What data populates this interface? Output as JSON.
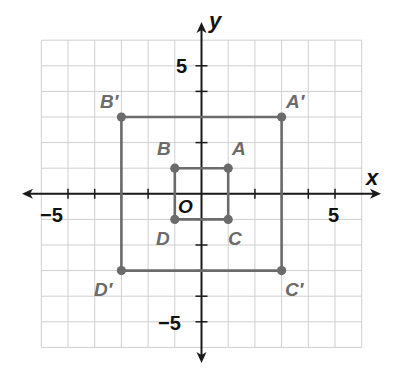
{
  "diagram": {
    "type": "coordinate-plane-dilation",
    "axes": {
      "x_label": "x",
      "y_label": "y",
      "origin_label": "O",
      "x_range": [
        -6,
        6
      ],
      "y_range": [
        -6,
        6
      ],
      "x_tick_labels": [
        {
          "value": -5,
          "label": "−5"
        },
        {
          "value": 5,
          "label": "5"
        }
      ],
      "y_tick_labels": [
        {
          "value": 5,
          "label": "5"
        },
        {
          "value": -5,
          "label": "−5"
        }
      ],
      "ticks": [
        -5,
        -4,
        -3,
        -2,
        -1,
        1,
        2,
        3,
        4,
        5
      ]
    },
    "colors": {
      "grid": "#cfcfcf",
      "axis": "#1a1a1a",
      "figure": "#6b6b6b",
      "label": "#6b6b6b"
    },
    "figures": [
      {
        "name": "ABCD",
        "points": [
          {
            "label": "A",
            "x": 1,
            "y": 1
          },
          {
            "label": "B",
            "x": -1,
            "y": 1
          },
          {
            "label": "D",
            "x": -1,
            "y": -1
          },
          {
            "label": "C",
            "x": 1,
            "y": -1
          }
        ]
      },
      {
        "name": "A'B'C'D'",
        "points": [
          {
            "label": "A′",
            "x": 3,
            "y": 3
          },
          {
            "label": "B′",
            "x": -3,
            "y": 3
          },
          {
            "label": "D′",
            "x": -3,
            "y": -3
          },
          {
            "label": "C′",
            "x": 3,
            "y": -3
          }
        ]
      }
    ]
  }
}
